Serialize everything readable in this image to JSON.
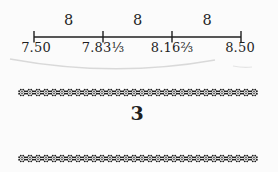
{
  "figure": {
    "type": "number-line",
    "segment_labels": [
      "8",
      "8",
      "8"
    ],
    "tick_labels": [
      "7.50",
      "7.83⅓",
      "8.16⅔",
      "8.50"
    ]
  },
  "page_number": "3",
  "colors": {
    "ink": "#1f1f1f",
    "background": "#fbfbfb",
    "arc_shadow": "#d9d9d9"
  }
}
